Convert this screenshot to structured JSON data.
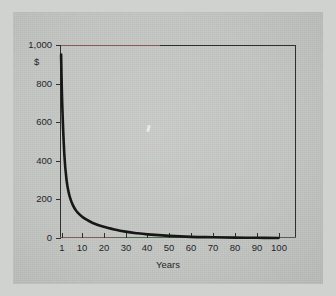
{
  "chart_data": {
    "type": "line",
    "title": "",
    "xlabel": "Years",
    "ylabel": "$",
    "xlim": [
      0,
      108
    ],
    "ylim": [
      0,
      1000
    ],
    "grid": false,
    "legend": "none",
    "x_ticks": [
      "1",
      "10",
      "20",
      "30",
      "40",
      "50",
      "60",
      "70",
      "80",
      "90",
      "100"
    ],
    "x_tick_values": [
      1,
      10,
      20,
      30,
      40,
      50,
      60,
      70,
      80,
      90,
      100
    ],
    "y_ticks": [
      "0",
      "200",
      "400",
      "600",
      "800",
      "1,000"
    ],
    "y_tick_values": [
      0,
      200,
      400,
      600,
      800,
      1000
    ],
    "series": [
      {
        "name": "Present value of $1,000",
        "color": "#171717",
        "x": [
          0.5,
          1,
          2,
          3,
          4,
          5,
          6,
          7,
          8,
          10,
          12,
          15,
          20,
          25,
          30,
          35,
          40,
          50,
          60,
          70,
          80,
          90,
          100
        ],
        "y": [
          950,
          700,
          430,
          300,
          235,
          195,
          168,
          148,
          133,
          112,
          96,
          78,
          58,
          44,
          33,
          25,
          19,
          11,
          6,
          4,
          2,
          1,
          0
        ]
      }
    ]
  },
  "axis": {
    "y_unit_label": "$",
    "x_title": "Years"
  },
  "colors": {
    "background": "#c5c7c4",
    "frame": "#2d2f31",
    "curve": "#171717",
    "text": "#24262a"
  }
}
